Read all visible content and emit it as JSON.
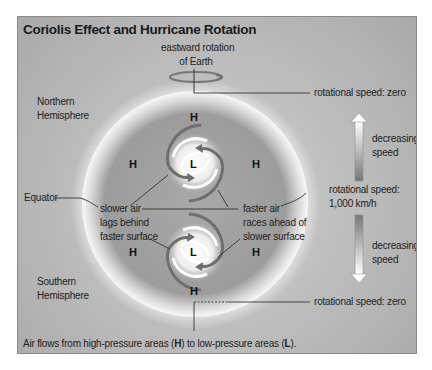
{
  "title": "Coriolis Effect and Hurricane Rotation",
  "labels": {
    "eastward_rotation": [
      "eastward rotation",
      "of Earth"
    ],
    "northern_hemisphere": [
      "Northern",
      "Hemisphere"
    ],
    "southern_hemisphere": [
      "Southern",
      "Hemisphere"
    ],
    "equator": "Equator",
    "slower_air": [
      "slower air",
      "lags behind",
      "faster surface"
    ],
    "faster_air": [
      "faster air",
      "races ahead of",
      "slower surface"
    ],
    "speed_zero_top": "rotational speed: zero",
    "speed_zero_bottom": "rotational speed: zero",
    "speed_equator": [
      "rotational speed:",
      "1,000 km/h"
    ],
    "decreasing_top": [
      "decreasing",
      "speed"
    ],
    "decreasing_bottom": [
      "decreasing",
      "speed"
    ]
  },
  "pressure_marks": {
    "high": "H",
    "low": "L"
  },
  "caption": {
    "prefix": "Air flows from high-pressure areas (",
    "high": "H",
    "middle": ") to low-pressure areas (",
    "low": "L",
    "suffix": ")."
  },
  "colors": {
    "globe": "#9a9a9a",
    "halo": "#f4f4f4",
    "background": "#b9b9b9",
    "arrow": "#6e6e6e",
    "line": "#333333"
  }
}
